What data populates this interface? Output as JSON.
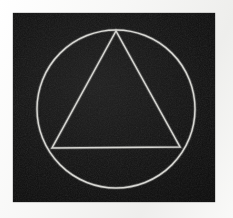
{
  "image": {
    "title": "Circle and triangle symbol",
    "description": "A white outlined circle with an inscribed equilateral triangle on a black field",
    "alt_text": "Circle enclosing a triangle",
    "canvas": {
      "width": 233,
      "height": 218
    }
  },
  "colors": {
    "page_background": "#fbfbfa",
    "panel_background": "#0c0c0c",
    "stroke": "#d8d8d4"
  },
  "panel": {
    "name": "black-field",
    "x": 13,
    "y": 13,
    "width": 202,
    "height": 189
  },
  "shapes": {
    "circle": {
      "name": "circle",
      "center_x": 103,
      "center_y": 96,
      "radius": 79,
      "stroke_width": 1.5
    },
    "triangle": {
      "name": "triangle",
      "points": "103,18 39,135 167,134",
      "vertices": [
        {
          "label": "apex",
          "x": 103,
          "y": 18
        },
        {
          "label": "bottom-left",
          "x": 39,
          "y": 135
        },
        {
          "label": "bottom-right",
          "x": 167,
          "y": 134
        }
      ],
      "stroke_width": 1.5
    }
  }
}
